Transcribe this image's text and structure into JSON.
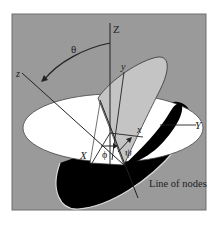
{
  "diagram": {
    "labels": {
      "Z": "Z",
      "z": "z",
      "y": "y",
      "x": "x",
      "X": "X",
      "Y": "Y",
      "theta": "θ",
      "phi": "ϕ",
      "psi": "ψ",
      "line_of_nodes": "Line of nodes"
    },
    "colors": {
      "background": "#9a9a9a",
      "frame": "#6e6e6e",
      "white_disc": "#ffffff",
      "light_disc": "#c4c4c4",
      "dark_disc": "#000000",
      "line": "#222222"
    }
  }
}
